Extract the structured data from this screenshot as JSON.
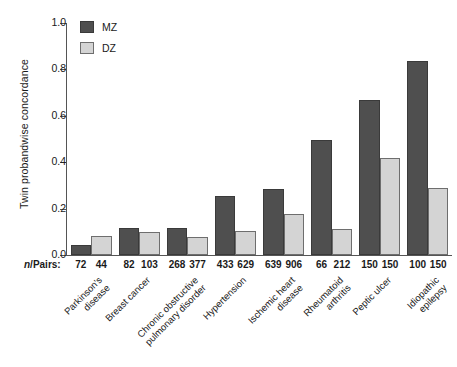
{
  "chart_data": {
    "type": "bar",
    "title": "",
    "xlabel": "",
    "ylabel": "Twin probandwise concordance",
    "ylim": [
      0.0,
      1.0
    ],
    "ytick_labels": [
      "0.0",
      "0.2",
      "0.4",
      "0.6",
      "0.8",
      "1.0"
    ],
    "ytick_values": [
      0.0,
      0.2,
      0.4,
      0.6,
      0.8,
      1.0
    ],
    "grid": false,
    "legend_position": "top-left",
    "categories": [
      "Parkinson's\ndisease",
      "Breast cancer",
      "Chronic obstructive\npulmonary disorder",
      "Hypertension",
      "Ischemic heart\ndisease",
      "Rheumatoid\narthritis",
      "Peptic ulcer",
      "Idiopathic\nepilepsy"
    ],
    "series": [
      {
        "name": "MZ",
        "color": "#4f4f4f",
        "values": [
          0.045,
          0.117,
          0.117,
          0.255,
          0.283,
          0.495,
          0.668,
          0.835
        ]
      },
      {
        "name": "DZ",
        "color": "#d4d4d4",
        "values": [
          0.08,
          0.1,
          0.077,
          0.105,
          0.175,
          0.11,
          0.42,
          0.29
        ]
      }
    ],
    "annotations": {
      "npairs_label": "n/Pairs:",
      "npairs_label_italic_prefix": "n",
      "npairs_label_rest": "/Pairs:",
      "npairs": [
        {
          "mz": "72",
          "dz": "44"
        },
        {
          "mz": "82",
          "dz": "103"
        },
        {
          "mz": "268",
          "dz": "377"
        },
        {
          "mz": "433",
          "dz": "629"
        },
        {
          "mz": "639",
          "dz": "906"
        },
        {
          "mz": "66",
          "dz": "212"
        },
        {
          "mz": "150",
          "dz": "150"
        },
        {
          "mz": "100",
          "dz": "150"
        }
      ]
    }
  },
  "legend": {
    "items": [
      {
        "label": "MZ",
        "swatch": "mz"
      },
      {
        "label": "DZ",
        "swatch": "dz"
      }
    ]
  }
}
